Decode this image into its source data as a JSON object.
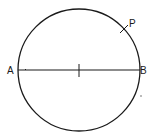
{
  "diagram": {
    "type": "geometry",
    "circle": {
      "cx": 79,
      "cy": 70,
      "r": 61,
      "stroke": "#1a1a1a"
    },
    "diameter": {
      "from": "A",
      "to": "B",
      "y": 70
    },
    "labels": {
      "A": "A",
      "B": "B",
      "P": "P"
    },
    "points": {
      "A": {
        "x": 18,
        "y": 70
      },
      "B": {
        "x": 140,
        "y": 70
      },
      "P": {
        "x": 124,
        "y": 30
      },
      "center": {
        "x": 79,
        "y": 70
      }
    },
    "marks": [
      "center-tick",
      "P-tick",
      "small-dot-near-B"
    ]
  }
}
